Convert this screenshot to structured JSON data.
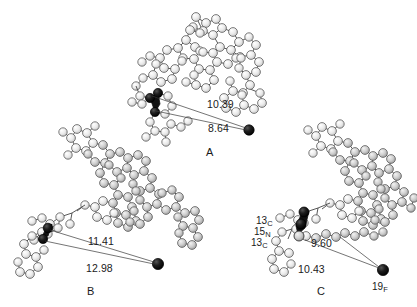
{
  "figure": {
    "background_color": "#ffffff",
    "line_color": "#333333",
    "atom_light_color": "#e8e8e8",
    "atom_mid_color": "#b8b8b8",
    "atom_dark_color": "#111111"
  },
  "panels": [
    {
      "id": "A",
      "letter": "A",
      "distances": [
        {
          "value": "10.39"
        },
        {
          "value": "8.64"
        }
      ],
      "isotope_labels": []
    },
    {
      "id": "B",
      "letter": "B",
      "distances": [
        {
          "value": "11.41"
        },
        {
          "value": "12.98"
        }
      ],
      "isotope_labels": []
    },
    {
      "id": "C",
      "letter": "C",
      "distances": [
        {
          "value": "9.60"
        },
        {
          "value": "10.43"
        }
      ],
      "isotope_labels": [
        {
          "mass": "13",
          "element": "C"
        },
        {
          "mass": "15",
          "element": "N"
        },
        {
          "mass": "13",
          "element": "C"
        },
        {
          "mass": "19",
          "element": "F"
        }
      ]
    }
  ],
  "labels": {
    "panel_a_dist1": "10.39",
    "panel_a_dist2": "8.64",
    "panel_b_dist1": "11.41",
    "panel_b_dist2": "12.98",
    "panel_c_dist1": "9.60",
    "panel_c_dist2": "10.43",
    "panel_a_letter": "A",
    "panel_b_letter": "B",
    "panel_c_letter": "C",
    "iso_13c_top_mass": "13",
    "iso_13c_top_el": "C",
    "iso_15n_mass": "15",
    "iso_15n_el": "N",
    "iso_13c_bottom_mass": "13",
    "iso_13c_bottom_el": "C",
    "iso_19f_mass": "19",
    "iso_19f_el": "F"
  }
}
